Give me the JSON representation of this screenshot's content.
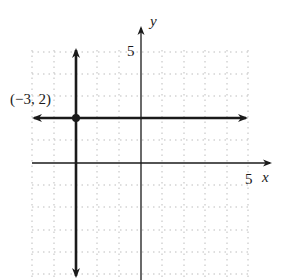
{
  "figure": {
    "type": "coordinate-plane graph",
    "axes": {
      "x_label": "x",
      "y_label": "y",
      "x_tick_label": "5",
      "y_tick_label": "5",
      "x_range": [
        -5,
        6
      ],
      "y_range": [
        -5,
        5
      ],
      "grid": "dotted"
    },
    "lines": [
      {
        "name": "horizontal-line",
        "equation": "y = 2",
        "arrows": "both"
      },
      {
        "name": "vertical-line",
        "equation": "x = -3",
        "arrows": "both"
      }
    ],
    "point": {
      "label": "(−3, 2)",
      "x": -3,
      "y": 2
    },
    "colors": {
      "ink": "#1a1a1a",
      "grid": "#b8b8b8",
      "background": "#ffffff"
    }
  }
}
